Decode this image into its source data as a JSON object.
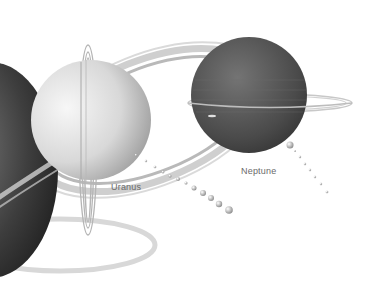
{
  "scene": {
    "title": "Outer planets illustration",
    "background": "#ffffff"
  },
  "labels": {
    "uranus": "Uranus",
    "neptune": "Neptune"
  },
  "colors": {
    "saturn_dark": "#3a3a3a",
    "uranus_light": "#e6e6e6",
    "neptune_dark": "#4a4a4a",
    "ring": "#bdbdbd"
  }
}
